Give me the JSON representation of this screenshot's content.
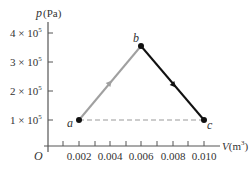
{
  "diagram": {
    "y_axis": {
      "label_var": "p",
      "label_unit": "(Pa)",
      "ticks": [
        {
          "mant": "4 × 10",
          "exp": "5",
          "value": 400000
        },
        {
          "mant": "3 × 10",
          "exp": "5",
          "value": 300000
        },
        {
          "mant": "2 × 10",
          "exp": "5",
          "value": 200000
        },
        {
          "mant": "1 × 10",
          "exp": "5",
          "value": 100000
        }
      ]
    },
    "x_axis": {
      "label_var": "V",
      "label_unit": "(m",
      "label_exp": "3",
      "label_close": ")",
      "ticks": [
        "0.002",
        "0.004",
        "0.006",
        "0.008",
        "0.010"
      ]
    },
    "origin_label": "O",
    "points": [
      {
        "name": "a",
        "V": 0.002,
        "p": 100000
      },
      {
        "name": "b",
        "V": 0.006,
        "p": 350000
      },
      {
        "name": "c",
        "V": 0.01,
        "p": 100000
      }
    ],
    "segments": [
      {
        "from": "a",
        "to": "b",
        "style": "solid",
        "color": "#a0a0a0",
        "arrow": true
      },
      {
        "from": "b",
        "to": "c",
        "style": "solid",
        "color": "#111111",
        "arrow": true
      },
      {
        "from": "c",
        "to": "a",
        "style": "dashed",
        "color": "#999999",
        "arrow": false
      }
    ]
  }
}
